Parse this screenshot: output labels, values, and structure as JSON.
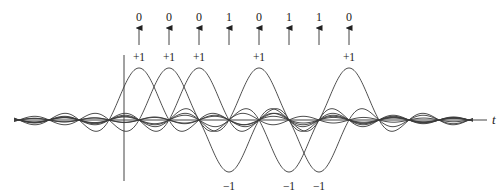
{
  "diagram": {
    "title": "",
    "bits": [
      "0",
      "0",
      "0",
      "1",
      "0",
      "1",
      "1",
      "0"
    ],
    "amplitudes": [
      1,
      1,
      1,
      -1,
      1,
      -1,
      -1,
      1
    ],
    "amplitude_labels": [
      "+1",
      "+1",
      "+1",
      "−1",
      "+1",
      "−1",
      "−1",
      "+1"
    ],
    "axis_label": "t",
    "pulse_shape": "sinc",
    "colors": {
      "stroke": "#3a3a3a",
      "text": "#222222",
      "background": "#ffffff"
    }
  },
  "layout": {
    "first_pulse_x": 139,
    "pulse_spacing": 30,
    "axis_y": 120,
    "pulse_amplitude_px": 52,
    "vertical_axis_x": 124,
    "x_start": 14,
    "x_end": 487
  }
}
